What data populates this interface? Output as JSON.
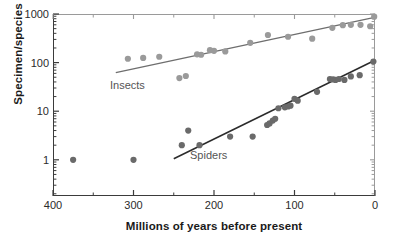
{
  "figure": {
    "width": 393,
    "height": 247,
    "background": "#ffffff"
  },
  "axes": {
    "x_title": "Millions of years before present",
    "y_title": "Specimen/species",
    "x_ticks": [
      {
        "value": 400,
        "label": "400"
      },
      {
        "value": 300,
        "label": "300"
      },
      {
        "value": 200,
        "label": "200"
      },
      {
        "value": 100,
        "label": "100"
      },
      {
        "value": 0,
        "label": "0"
      }
    ],
    "y_ticks": [
      {
        "value": 1000,
        "label": "1000"
      },
      {
        "value": 100,
        "label": "100"
      },
      {
        "value": 10,
        "label": "10"
      },
      {
        "value": 1,
        "label": "1"
      }
    ],
    "x_minor_step": 50,
    "y_scale": "log10",
    "x_reversed": true
  },
  "colors": {
    "insects_marker": "#9a9a9a",
    "insects_line": "#6e6e6e",
    "spiders_marker": "#6a6a6a",
    "spiders_line": "#2b2b2b",
    "axis": "#3b3b3b",
    "axis_light": "#9a9a9a",
    "text": "#1a1a1a",
    "annotation": "#555555"
  },
  "chart_data": {
    "type": "scatter",
    "title": "",
    "xlabel": "Millions of years before present",
    "ylabel": "Specimen/species",
    "xlim": [
      400,
      0
    ],
    "ylim": [
      0.18,
      1000
    ],
    "yscale": "log",
    "xscale": "linear",
    "grid": false,
    "legend": "inline-annotations",
    "x_reversed": true,
    "series": [
      {
        "name": "Insects",
        "marker": "circle",
        "color": "#9a9a9a",
        "annotation": "Insects",
        "points": [
          {
            "x": 307,
            "y": 120
          },
          {
            "x": 288,
            "y": 125
          },
          {
            "x": 268,
            "y": 132
          },
          {
            "x": 243,
            "y": 48
          },
          {
            "x": 235,
            "y": 53
          },
          {
            "x": 221,
            "y": 148
          },
          {
            "x": 216,
            "y": 145
          },
          {
            "x": 205,
            "y": 180
          },
          {
            "x": 200,
            "y": 175
          },
          {
            "x": 186,
            "y": 170
          },
          {
            "x": 155,
            "y": 255
          },
          {
            "x": 133,
            "y": 370
          },
          {
            "x": 108,
            "y": 340
          },
          {
            "x": 78,
            "y": 310
          },
          {
            "x": 53,
            "y": 520
          },
          {
            "x": 40,
            "y": 590
          },
          {
            "x": 30,
            "y": 600
          },
          {
            "x": 18,
            "y": 600
          },
          {
            "x": 6,
            "y": 560
          },
          {
            "x": 1,
            "y": 880
          }
        ],
        "trendline": {
          "x_start": 322,
          "y_start": 62,
          "x_end": 2,
          "y_end": 840
        }
      },
      {
        "name": "Spiders",
        "marker": "circle",
        "color": "#6a6a6a",
        "annotation": "Spiders",
        "points": [
          {
            "x": 375,
            "y": 1.0
          },
          {
            "x": 300,
            "y": 1.0
          },
          {
            "x": 240,
            "y": 2.0
          },
          {
            "x": 232,
            "y": 4.0
          },
          {
            "x": 218,
            "y": 2.0
          },
          {
            "x": 180,
            "y": 3.0
          },
          {
            "x": 152,
            "y": 3.0
          },
          {
            "x": 134,
            "y": 5.2
          },
          {
            "x": 131,
            "y": 5.6
          },
          {
            "x": 127,
            "y": 6.4
          },
          {
            "x": 124,
            "y": 7.0
          },
          {
            "x": 120,
            "y": 11.5
          },
          {
            "x": 112,
            "y": 12.0
          },
          {
            "x": 108,
            "y": 12.5
          },
          {
            "x": 105,
            "y": 13.0
          },
          {
            "x": 100,
            "y": 18.0
          },
          {
            "x": 96,
            "y": 16.5
          },
          {
            "x": 72,
            "y": 25.0
          },
          {
            "x": 56,
            "y": 46.0
          },
          {
            "x": 52,
            "y": 45.0
          },
          {
            "x": 49,
            "y": 44.0
          },
          {
            "x": 45,
            "y": 46.0
          },
          {
            "x": 38,
            "y": 44.0
          },
          {
            "x": 30,
            "y": 52.0
          },
          {
            "x": 19,
            "y": 55.0
          },
          {
            "x": 2,
            "y": 105.0
          }
        ],
        "trendline": {
          "x_start": 250,
          "y_start": 1.05,
          "x_end": 2,
          "y_end": 108
        }
      }
    ]
  }
}
